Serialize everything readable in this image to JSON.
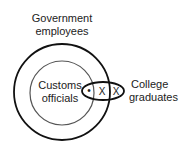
{
  "diagram": {
    "type": "venn",
    "sets": [
      {
        "id": "gov",
        "label_line1": "Government",
        "label_line2": "employees"
      },
      {
        "id": "customs",
        "label_line1": "Customs",
        "label_line2": "officials"
      },
      {
        "id": "college",
        "label_line1": "College",
        "label_line2": "graduates"
      }
    ],
    "marks": {
      "dot": "•",
      "x1": "X",
      "x2": "X"
    },
    "colors": {
      "stroke": "#111111",
      "inner_stroke": "#444444"
    }
  }
}
